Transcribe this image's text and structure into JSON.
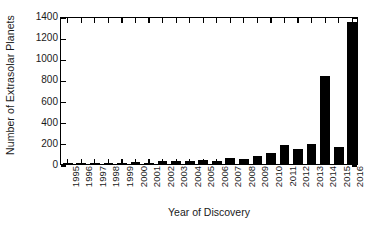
{
  "chart_data": {
    "type": "bar",
    "title": "",
    "xlabel": "Year of Discovery",
    "ylabel": "Number of Extrasolar Planets",
    "categories": [
      "1995",
      "1996",
      "1997",
      "1998",
      "1999",
      "2000",
      "2001",
      "2002",
      "2003",
      "2004",
      "2005",
      "2006",
      "2007",
      "2008",
      "2009",
      "2010",
      "2011",
      "2012",
      "2013",
      "2014",
      "2015",
      "2016"
    ],
    "values": [
      1,
      6,
      1,
      5,
      13,
      16,
      12,
      31,
      25,
      25,
      37,
      30,
      54,
      52,
      77,
      108,
      184,
      143,
      191,
      830,
      165,
      1340
    ],
    "ylim": [
      0,
      1400
    ],
    "yticks": [
      0,
      200,
      400,
      600,
      800,
      1000,
      1200,
      1400
    ],
    "yticklabels": [
      "0",
      "200",
      "400",
      "600",
      "800",
      "1000",
      "1200",
      "1400"
    ],
    "grid": false,
    "legend": null,
    "bar_color": "#000000",
    "frame_color": "#000000",
    "xtick_rotation": 90
  }
}
